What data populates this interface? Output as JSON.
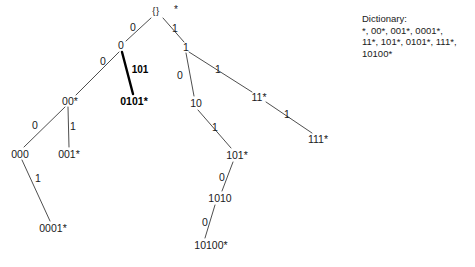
{
  "figure": {
    "type": "binary-trie-diagram",
    "background_color": "#ffffff",
    "line_color": "#3a3a3a",
    "highlight_color": "#000000"
  },
  "tree": {
    "root": {
      "label": "{}",
      "star": "*"
    },
    "nodes": [
      {
        "id": "root",
        "label": "{}",
        "x": 156,
        "y": 11,
        "bold": false,
        "star": true
      },
      {
        "id": "n0",
        "label": "0",
        "x": 121,
        "y": 45,
        "bold": false,
        "star": false
      },
      {
        "id": "n1",
        "label": "1",
        "x": 186,
        "y": 47,
        "bold": false,
        "star": false
      },
      {
        "id": "n00",
        "label": "00*",
        "x": 70,
        "y": 101,
        "bold": false,
        "star": false
      },
      {
        "id": "n0101",
        "label": "0101*",
        "x": 134,
        "y": 101,
        "bold": true,
        "star": false
      },
      {
        "id": "n000",
        "label": "000",
        "x": 20,
        "y": 154,
        "bold": false,
        "star": false
      },
      {
        "id": "n001",
        "label": "001*",
        "x": 69,
        "y": 154,
        "bold": false,
        "star": false
      },
      {
        "id": "n0001",
        "label": "0001*",
        "x": 53,
        "y": 228,
        "bold": false,
        "star": false
      },
      {
        "id": "n10",
        "label": "10",
        "x": 196,
        "y": 103,
        "bold": false,
        "star": false
      },
      {
        "id": "n11",
        "label": "11*",
        "x": 259,
        "y": 97,
        "bold": false,
        "star": false
      },
      {
        "id": "n111",
        "label": "111*",
        "x": 318,
        "y": 139,
        "bold": false,
        "star": false
      },
      {
        "id": "n101",
        "label": "101*",
        "x": 237,
        "y": 155,
        "bold": false,
        "star": false
      },
      {
        "id": "n1010",
        "label": "1010",
        "x": 220,
        "y": 198,
        "bold": false,
        "star": false
      },
      {
        "id": "n10100",
        "label": "10100*",
        "x": 211,
        "y": 245,
        "bold": false,
        "star": false
      }
    ],
    "edges": [
      {
        "from": "root",
        "to": "n0",
        "label": "0",
        "lx": 133,
        "ly": 27,
        "bold": false,
        "x1": 151,
        "y1": 18,
        "x2": 126,
        "y2": 41
      },
      {
        "from": "root",
        "to": "n1",
        "label": "1",
        "lx": 175,
        "ly": 28,
        "bold": false,
        "x1": 163,
        "y1": 18,
        "x2": 184,
        "y2": 42
      },
      {
        "from": "n0",
        "to": "n00",
        "label": "0",
        "lx": 103,
        "ly": 61,
        "bold": false,
        "x1": 119,
        "y1": 52,
        "x2": 76,
        "y2": 95
      },
      {
        "from": "n0",
        "to": "n0101",
        "label": "101",
        "lx": 140,
        "ly": 70,
        "bold": true,
        "x1": 122,
        "y1": 52,
        "x2": 133,
        "y2": 94
      },
      {
        "from": "n00",
        "to": "n000",
        "label": "0",
        "lx": 35,
        "ly": 125,
        "bold": false,
        "x1": 65,
        "y1": 107,
        "x2": 24,
        "y2": 147
      },
      {
        "from": "n00",
        "to": "n001",
        "label": "1",
        "lx": 73,
        "ly": 126,
        "bold": false,
        "x1": 68,
        "y1": 107,
        "x2": 69,
        "y2": 147
      },
      {
        "from": "n000",
        "to": "n0001",
        "label": "1",
        "lx": 38,
        "ly": 178,
        "bold": false,
        "x1": 22,
        "y1": 160,
        "x2": 50,
        "y2": 221
      },
      {
        "from": "n1",
        "to": "n10",
        "label": "0",
        "lx": 180,
        "ly": 75,
        "bold": false,
        "x1": 186,
        "y1": 53,
        "x2": 194,
        "y2": 96
      },
      {
        "from": "n1",
        "to": "n11",
        "label": "1",
        "lx": 218,
        "ly": 69,
        "bold": false,
        "x1": 189,
        "y1": 52,
        "x2": 252,
        "y2": 92
      },
      {
        "from": "n10",
        "to": "n101",
        "label": "1",
        "lx": 215,
        "ly": 127,
        "bold": false,
        "x1": 198,
        "y1": 110,
        "x2": 231,
        "y2": 148
      },
      {
        "from": "n11",
        "to": "n111",
        "label": "1",
        "lx": 287,
        "ly": 114,
        "bold": false,
        "x1": 266,
        "y1": 102,
        "x2": 312,
        "y2": 133
      },
      {
        "from": "n101",
        "to": "n1010",
        "label": "0",
        "lx": 222,
        "ly": 177,
        "bold": false,
        "x1": 233,
        "y1": 162,
        "x2": 222,
        "y2": 191
      },
      {
        "from": "n1010",
        "to": "n10100",
        "label": "0",
        "lx": 205,
        "ly": 222,
        "bold": false,
        "x1": 215,
        "y1": 205,
        "x2": 205,
        "y2": 238
      }
    ]
  },
  "dictionary": {
    "title": "Dictionary:",
    "lines": [
      "*, 00*, 001*, 0001*,",
      "11*, 101*, 0101*, 111*,",
      "10100*"
    ],
    "entries": [
      "*",
      "00*",
      "001*",
      "0001*",
      "11*",
      "101*",
      "0101*",
      "111*",
      "10100*"
    ]
  }
}
